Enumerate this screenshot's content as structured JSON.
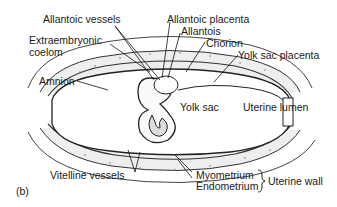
{
  "figure": {
    "panel_label": "(b)",
    "labels": {
      "allantoic_vessels": "Allantoic vessels",
      "extraembryonic_coelom_1": "Extraembryonic",
      "extraembryonic_coelom_2": "coelom",
      "amnion": "Amnion",
      "allantoic_placenta": "Allantoic placenta",
      "allantois": "Allantois",
      "chorion": "Chorion",
      "yolk_sac_placenta": "Yolk sac placenta",
      "yolk_sac": "Yolk sac",
      "uterine_lumen": "Uterine lumen",
      "vitelline_vessels": "Vitelline vessels",
      "myometrium": "Myometrium",
      "endometrium": "Endometrium",
      "uterine_wall": "Uterine wall"
    }
  }
}
